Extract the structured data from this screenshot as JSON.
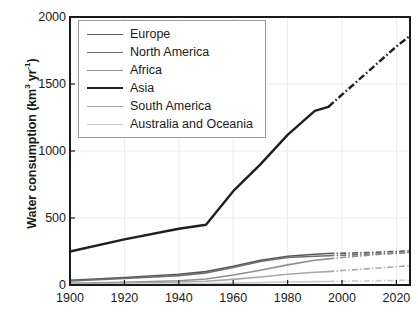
{
  "chart_data": {
    "type": "line",
    "title": "",
    "xlabel": "",
    "ylabel": "Water consumption (km3 yr-1)",
    "ylabel_parts": {
      "main": "Water consumption (km",
      "sup1": "3",
      "mid": " yr",
      "sup2": "-1",
      "tail": ")"
    },
    "xlim": [
      1900,
      2025
    ],
    "ylim": [
      0,
      2000
    ],
    "xticks": [
      1900,
      1920,
      1940,
      1960,
      1980,
      2000,
      2020
    ],
    "yticks": [
      0,
      500,
      1000,
      1500,
      2000
    ],
    "grid": true,
    "grid_note": "faint light-gray vertical and horizontal gridlines",
    "legend_position": "upper-left inside axes",
    "projection_note": "solid lines are observations to ~1995; dash-dot segments are projections to 2025",
    "series": [
      {
        "name": "Europe",
        "color": "#595959",
        "width": 1.6,
        "x": [
          1900,
          1920,
          1940,
          1950,
          1960,
          1970,
          1980,
          1990,
          1995
        ],
        "values": [
          35,
          55,
          80,
          100,
          140,
          185,
          215,
          230,
          235
        ],
        "proj_x": [
          1995,
          2000,
          2010,
          2020,
          2025
        ],
        "proj_values": [
          235,
          237,
          243,
          250,
          255
        ]
      },
      {
        "name": "North America",
        "color": "#6e6e6e",
        "width": 1.6,
        "x": [
          1900,
          1920,
          1940,
          1950,
          1960,
          1970,
          1980,
          1990,
          1995
        ],
        "values": [
          30,
          48,
          70,
          90,
          130,
          175,
          205,
          215,
          218
        ],
        "proj_x": [
          1995,
          2000,
          2010,
          2020,
          2025
        ],
        "proj_values": [
          218,
          222,
          230,
          238,
          243
        ]
      },
      {
        "name": "Africa",
        "color": "#8f8f8f",
        "width": 1.6,
        "x": [
          1900,
          1920,
          1940,
          1950,
          1960,
          1970,
          1980,
          1990,
          1995
        ],
        "values": [
          12,
          20,
          32,
          45,
          75,
          110,
          150,
          185,
          195
        ],
        "proj_x": [
          1995,
          2000,
          2010,
          2020,
          2025
        ],
        "proj_values": [
          195,
          205,
          222,
          238,
          248
        ]
      },
      {
        "name": "Asia",
        "color": "#1f1f1f",
        "width": 2.4,
        "x": [
          1900,
          1920,
          1940,
          1950,
          1960,
          1970,
          1980,
          1990,
          1995
        ],
        "values": [
          250,
          340,
          420,
          450,
          700,
          900,
          1120,
          1300,
          1330
        ],
        "proj_x": [
          1995,
          2000,
          2010,
          2020,
          2025
        ],
        "proj_values": [
          1330,
          1420,
          1600,
          1780,
          1860
        ]
      },
      {
        "name": "South America",
        "color": "#a8a8a8",
        "width": 1.6,
        "x": [
          1900,
          1920,
          1940,
          1950,
          1960,
          1970,
          1980,
          1990,
          1995
        ],
        "values": [
          10,
          15,
          22,
          28,
          42,
          60,
          80,
          95,
          100
        ],
        "proj_x": [
          1995,
          2000,
          2010,
          2020,
          2025
        ],
        "proj_values": [
          100,
          108,
          122,
          136,
          145
        ]
      },
      {
        "name": "Australia and Oceania",
        "color": "#cacaca",
        "width": 1.6,
        "x": [
          1900,
          1920,
          1940,
          1950,
          1960,
          1970,
          1980,
          1990,
          1995
        ],
        "values": [
          4,
          6,
          8,
          10,
          14,
          18,
          22,
          25,
          26
        ],
        "proj_x": [
          1995,
          2000,
          2010,
          2020,
          2025
        ],
        "proj_values": [
          26,
          28,
          31,
          34,
          36
        ]
      }
    ]
  },
  "legend": {
    "items": [
      {
        "label": "Europe"
      },
      {
        "label": "North America"
      },
      {
        "label": "Africa"
      },
      {
        "label": "Asia"
      },
      {
        "label": "South America"
      },
      {
        "label": "Australia and Oceania"
      }
    ]
  },
  "axes": {
    "ylabel_text": "Water consumption (km3 yr-1)",
    "ytick_labels": [
      "2000",
      "1500",
      "1000",
      "500",
      "0"
    ],
    "xtick_labels": [
      "1900",
      "1920",
      "1940",
      "1960",
      "1980",
      "2000",
      "2020"
    ]
  }
}
